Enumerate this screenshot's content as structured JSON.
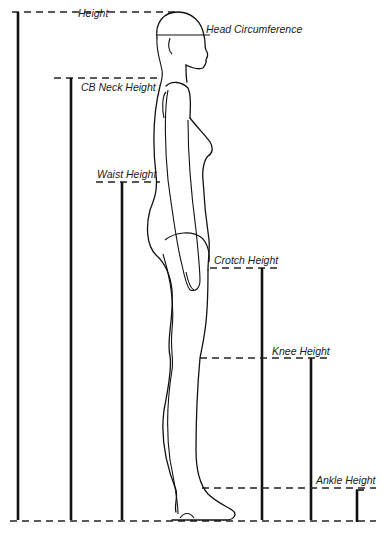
{
  "diagram": {
    "colors": {
      "line": "#111111",
      "background": "#ffffff"
    },
    "measurements": [
      {
        "id": "height",
        "label": "Height"
      },
      {
        "id": "head-circumference",
        "label": "Head Circumference"
      },
      {
        "id": "cb-neck-height",
        "label": "CB Neck Height"
      },
      {
        "id": "waist-height",
        "label": "Waist Height"
      },
      {
        "id": "crotch-height",
        "label": "Crotch Height"
      },
      {
        "id": "knee-height",
        "label": "Knee Height"
      },
      {
        "id": "ankle-height",
        "label": "Ankle Height"
      }
    ]
  }
}
